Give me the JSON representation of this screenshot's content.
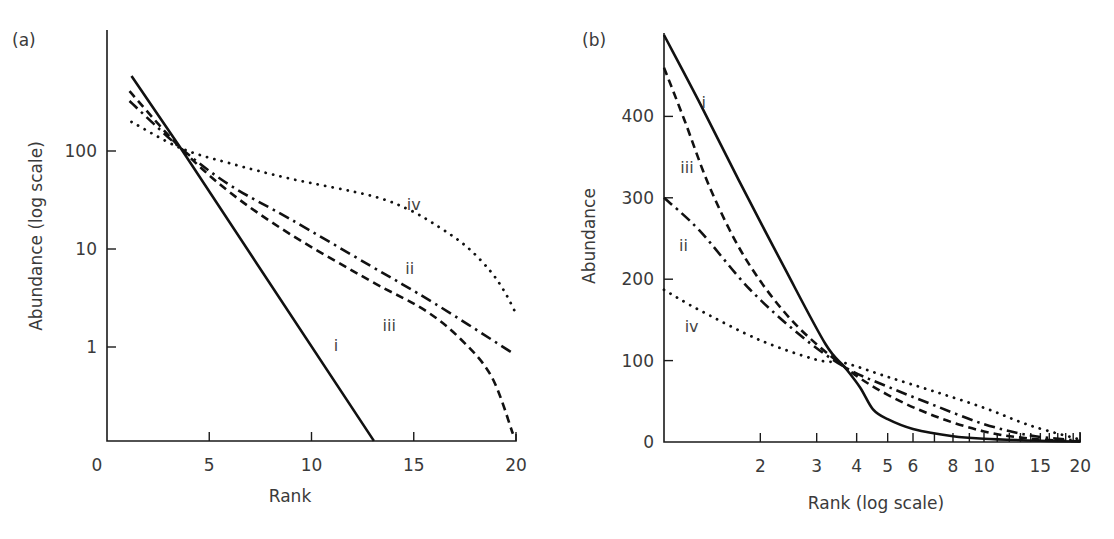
{
  "chart_data": [
    {
      "panel_label": "(a)",
      "type": "line",
      "title": "",
      "xlabel": "Rank",
      "ylabel": "Abundance (log scale)",
      "xscale": "linear",
      "yscale": "log",
      "xlim": [
        0,
        20
      ],
      "ylim": [
        0.11,
        1600
      ],
      "x_ticks": [
        0,
        5,
        10,
        15,
        20
      ],
      "x_tick_labels": [
        "0",
        "5",
        "10",
        "15",
        "20"
      ],
      "y_ticks": [
        1,
        10,
        100
      ],
      "y_tick_labels": [
        "1",
        "10",
        "100"
      ],
      "grid": false,
      "legend": "inline curve labels",
      "series": [
        {
          "name": "i",
          "style": "solid",
          "label_pos": {
            "x": 11.2,
            "y": 0.9
          },
          "points": [
            [
              1.2,
              584
            ],
            [
              3.6,
              107
            ],
            [
              13.05,
              0.11
            ]
          ]
        },
        {
          "name": "ii",
          "style": "dash-dot",
          "label_pos": {
            "x": 14.8,
            "y": 5.5
          },
          "points": [
            [
              1.1,
              324
            ],
            [
              3.6,
              107
            ],
            [
              6,
              45
            ],
            [
              9,
              20
            ],
            [
              12.9,
              6.7
            ],
            [
              16,
              2.8
            ],
            [
              19.9,
              0.85
            ]
          ]
        },
        {
          "name": "iii",
          "style": "dashed",
          "label_pos": {
            "x": 13.8,
            "y": 1.45
          },
          "points": [
            [
              1.1,
              408
            ],
            [
              3.6,
              107
            ],
            [
              6,
              38
            ],
            [
              9,
              14
            ],
            [
              12.9,
              4.7
            ],
            [
              15.5,
              2.4
            ],
            [
              17.3,
              1.2
            ],
            [
              18.8,
              0.5
            ],
            [
              19.85,
              0.13
            ]
          ]
        },
        {
          "name": "iv",
          "style": "dotted",
          "label_pos": {
            "x": 15.0,
            "y": 25
          },
          "points": [
            [
              1.2,
              198
            ],
            [
              3.6,
              107
            ],
            [
              6,
              75
            ],
            [
              9,
              52
            ],
            [
              12.9,
              35
            ],
            [
              14.8,
              25
            ],
            [
              16.3,
              16.4
            ],
            [
              17.6,
              10.5
            ],
            [
              18.7,
              6.1
            ],
            [
              19.4,
              3.8
            ],
            [
              19.95,
              2.3
            ]
          ]
        }
      ]
    },
    {
      "panel_label": "(b)",
      "type": "line",
      "title": "",
      "xlabel": "Rank (log scale)",
      "ylabel": "Abundance",
      "xscale": "log",
      "yscale": "linear",
      "xlim": [
        1,
        20
      ],
      "ylim": [
        0,
        500
      ],
      "x_ticks": [
        2,
        3,
        4,
        5,
        6,
        7,
        8,
        9,
        10,
        11,
        12,
        13,
        14,
        15,
        16,
        17,
        18,
        19,
        20
      ],
      "x_tick_labels": [
        "2",
        "3",
        "4",
        "5",
        "6",
        "",
        "8",
        "",
        "10",
        "",
        "",
        "",
        "",
        "15",
        "",
        "",
        "",
        "",
        "20"
      ],
      "y_ticks": [
        0,
        100,
        200,
        300,
        400
      ],
      "y_tick_labels": [
        "0",
        "100",
        "200",
        "300",
        "400"
      ],
      "grid": false,
      "legend": "inline curve labels",
      "series": [
        {
          "name": "i",
          "style": "solid",
          "label_pos": {
            "x": 1.33,
            "y": 410
          },
          "points": [
            [
              1,
              500
            ],
            [
              1.28,
              420
            ],
            [
              1.71,
              322
            ],
            [
              2.4,
              211
            ],
            [
              3.2,
              120
            ],
            [
              3.67,
              92
            ],
            [
              4.1,
              67
            ],
            [
              4.5,
              40
            ],
            [
              5.0,
              28
            ],
            [
              6,
              16
            ],
            [
              8,
              7
            ],
            [
              10,
              4
            ],
            [
              15,
              1.5
            ],
            [
              20,
              0.5
            ]
          ]
        },
        {
          "name": "ii",
          "style": "dash-dot",
          "label_pos": {
            "x": 1.15,
            "y": 235
          },
          "points": [
            [
              1,
              300
            ],
            [
              1.29,
              260
            ],
            [
              1.85,
              188
            ],
            [
              2.65,
              132
            ],
            [
              3.67,
              92
            ],
            [
              5,
              68
            ],
            [
              7,
              45
            ],
            [
              10,
              22
            ],
            [
              14,
              8
            ],
            [
              20,
              1.5
            ]
          ]
        },
        {
          "name": "iii",
          "style": "dashed",
          "label_pos": {
            "x": 1.18,
            "y": 330
          },
          "points": [
            [
              1,
              460
            ],
            [
              1.16,
              395
            ],
            [
              1.4,
              310
            ],
            [
              1.8,
              225
            ],
            [
              2.5,
              150
            ],
            [
              3.67,
              92
            ],
            [
              5,
              58
            ],
            [
              7,
              32
            ],
            [
              10,
              13
            ],
            [
              14,
              4
            ],
            [
              20,
              0.8
            ]
          ]
        },
        {
          "name": "iv",
          "style": "dotted",
          "label_pos": {
            "x": 1.22,
            "y": 135
          },
          "points": [
            [
              1,
              187
            ],
            [
              1.29,
              162
            ],
            [
              2.0,
              125
            ],
            [
              3.0,
              101
            ],
            [
              3.67,
              97
            ],
            [
              5,
              80
            ],
            [
              7,
              62
            ],
            [
              10,
              42
            ],
            [
              14,
              20
            ],
            [
              20,
              3
            ]
          ]
        }
      ]
    }
  ],
  "panels": {
    "a": {
      "label": "(a)",
      "xlabel": "Rank",
      "ylabel": "Abundance (log scale)"
    },
    "b": {
      "label": "(b)",
      "xlabel": "Rank (log scale)",
      "ylabel": "Abundance"
    }
  }
}
